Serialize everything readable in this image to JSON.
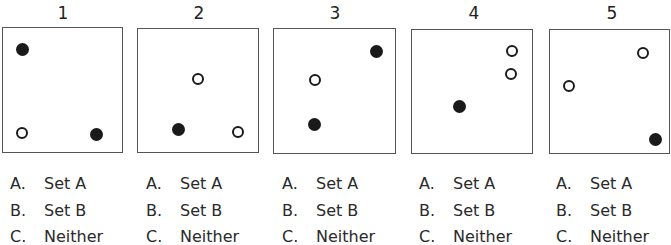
{
  "panels": [
    {
      "number": "1",
      "box": {
        "left": 2,
        "top": 27,
        "width": 121,
        "height": 126
      },
      "number_x": 63,
      "dots": [
        {
          "x": 19,
          "y": 21,
          "type": "filled"
        },
        {
          "x": 19,
          "y": 105,
          "type": "open"
        },
        {
          "x": 93,
          "y": 106,
          "type": "filled"
        }
      ],
      "options_left": 10,
      "options": [
        {
          "letter": "A.",
          "label": "Set A"
        },
        {
          "letter": "B.",
          "label": "Set B"
        },
        {
          "letter": "C.",
          "label": "Neither"
        }
      ]
    },
    {
      "number": "2",
      "box": {
        "left": 137,
        "top": 28,
        "width": 122,
        "height": 125
      },
      "number_x": 199,
      "dots": [
        {
          "x": 60,
          "y": 50,
          "type": "open"
        },
        {
          "x": 40,
          "y": 100,
          "type": "filled"
        },
        {
          "x": 100,
          "y": 103,
          "type": "open"
        }
      ],
      "options_left": 146,
      "options": [
        {
          "letter": "A.",
          "label": "Set A"
        },
        {
          "letter": "B.",
          "label": "Set B"
        },
        {
          "letter": "C.",
          "label": "Neither"
        }
      ]
    },
    {
      "number": "3",
      "box": {
        "left": 273,
        "top": 28,
        "width": 123,
        "height": 126
      },
      "number_x": 335,
      "dots": [
        {
          "x": 102,
          "y": 22,
          "type": "filled"
        },
        {
          "x": 41,
          "y": 51,
          "type": "open"
        },
        {
          "x": 40,
          "y": 95,
          "type": "filled"
        }
      ],
      "options_left": 282,
      "options": [
        {
          "letter": "A.",
          "label": "Set A"
        },
        {
          "letter": "B.",
          "label": "Set B"
        },
        {
          "letter": "C.",
          "label": "Neither"
        }
      ]
    },
    {
      "number": "4",
      "box": {
        "left": 411,
        "top": 29,
        "width": 122,
        "height": 125
      },
      "number_x": 474,
      "dots": [
        {
          "x": 100,
          "y": 21,
          "type": "open"
        },
        {
          "x": 99,
          "y": 44,
          "type": "open"
        },
        {
          "x": 47,
          "y": 76,
          "type": "filled"
        }
      ],
      "options_left": 419,
      "options": [
        {
          "letter": "A.",
          "label": "Set A"
        },
        {
          "letter": "B.",
          "label": "Set B"
        },
        {
          "letter": "C.",
          "label": "Neither"
        }
      ]
    },
    {
      "number": "5",
      "box": {
        "left": 549,
        "top": 29,
        "width": 121,
        "height": 125
      },
      "number_x": 612,
      "dots": [
        {
          "x": 93,
          "y": 23,
          "type": "open"
        },
        {
          "x": 19,
          "y": 56,
          "type": "open"
        },
        {
          "x": 105,
          "y": 109,
          "type": "filled"
        }
      ],
      "options_left": 556,
      "options": [
        {
          "letter": "A.",
          "label": "Set A"
        },
        {
          "letter": "B.",
          "label": "Set B"
        },
        {
          "letter": "C.",
          "label": "Neither"
        }
      ]
    }
  ],
  "legend_symbols": {
    "filled": "filled-circle",
    "open": "open-circle"
  },
  "colors": {
    "ink": "#1a1a1a",
    "border": "#555555",
    "background": "#ffffff"
  }
}
